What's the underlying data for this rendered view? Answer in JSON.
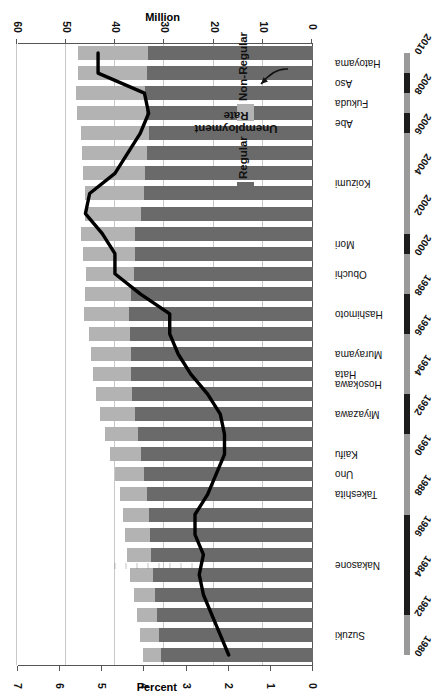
{
  "chart_data": {
    "type": "bar",
    "orientation": "horizontal-stacked-with-line",
    "title": "",
    "subtitle": "",
    "xlabel": "",
    "ylabel": "",
    "grid": true,
    "legend_position": "inside-left",
    "primary_axis": {
      "name": "Million",
      "title": "Million",
      "ticks": [
        0,
        10,
        20,
        30,
        40,
        50,
        60
      ],
      "tick_labels": [
        "0",
        "10",
        "20",
        "30",
        "40",
        "50",
        "60"
      ],
      "lim": [
        0,
        60
      ]
    },
    "secondary_axis": {
      "name": "Percent",
      "title": "Percent",
      "ticks": [
        0,
        1,
        2,
        3,
        4,
        5,
        6,
        7
      ],
      "tick_labels": [
        "0",
        "1",
        "2",
        "3",
        "4",
        "5",
        "6",
        "7"
      ],
      "lim": [
        0,
        7
      ]
    },
    "categories": [
      "1980",
      "1981",
      "1982",
      "1983",
      "1984",
      "1985",
      "1986",
      "1987",
      "1988",
      "1989",
      "1990",
      "1991",
      "1992",
      "1993",
      "1994",
      "1995",
      "1996",
      "1997",
      "1998",
      "1999",
      "2000",
      "2001",
      "2002",
      "2003",
      "2004",
      "2005",
      "2006",
      "2007",
      "2008",
      "2009",
      "2010"
    ],
    "category_axis_labels": [
      "1980",
      "1982",
      "1984",
      "1986",
      "1988",
      "1990",
      "1992",
      "1994",
      "1996",
      "1998",
      "2000",
      "2002",
      "2004",
      "2006",
      "2008",
      "2010"
    ],
    "series": [
      {
        "name": "Regular",
        "color": "#6a6a6a",
        "unit": "Million",
        "values": [
          31.0,
          31.4,
          31.8,
          32.2,
          32.6,
          32.9,
          33.2,
          33.4,
          33.8,
          34.3,
          34.9,
          35.6,
          36.3,
          36.8,
          37.0,
          37.1,
          37.2,
          37.5,
          37.0,
          36.4,
          36.3,
          36.2,
          34.9,
          34.4,
          34.1,
          33.7,
          33.4,
          33.9,
          34.1,
          33.8,
          33.6
        ]
      },
      {
        "name": "Non-Regular",
        "color": "#b3b3b3",
        "unit": "Million",
        "values": [
          3.5,
          3.7,
          3.9,
          4.3,
          4.6,
          4.9,
          5.1,
          5.3,
          5.5,
          6.0,
          6.4,
          6.7,
          7.0,
          7.4,
          7.7,
          8.0,
          8.4,
          9.0,
          9.4,
          9.8,
          10.4,
          11.0,
          11.5,
          12.0,
          12.7,
          13.2,
          13.7,
          14.0,
          14.1,
          13.9,
          14.1
        ]
      },
      {
        "name": "Unemployment Rate",
        "type": "line",
        "color": "#000000",
        "unit": "Percent",
        "axis": "secondary",
        "values": [
          2.0,
          2.2,
          2.4,
          2.6,
          2.7,
          2.6,
          2.8,
          2.8,
          2.5,
          2.3,
          2.1,
          2.1,
          2.2,
          2.5,
          2.9,
          3.2,
          3.4,
          3.4,
          4.1,
          4.7,
          4.7,
          5.0,
          5.4,
          5.3,
          4.7,
          4.4,
          4.1,
          3.9,
          4.0,
          5.1,
          5.1
        ]
      }
    ],
    "annotations": [
      {
        "name": "unemployment-rate-callout",
        "text_line1": "Unemployment",
        "text_line2": "Rate"
      }
    ],
    "prime_ministers": [
      {
        "name": "Suzuki",
        "start": 1980,
        "end": 1982
      },
      {
        "name": "Nakasone",
        "start": 1982,
        "end": 1987
      },
      {
        "name": "Takeshita",
        "start": 1987,
        "end": 1989
      },
      {
        "name": "Uno",
        "start": 1989,
        "end": 1989
      },
      {
        "name": "Kaifu",
        "start": 1989,
        "end": 1991
      },
      {
        "name": "Miyazawa",
        "start": 1991,
        "end": 1993
      },
      {
        "name": "Hosokawa",
        "start": 1993,
        "end": 1994
      },
      {
        "name": "Hata",
        "start": 1994,
        "end": 1994
      },
      {
        "name": "Murayama",
        "start": 1994,
        "end": 1996
      },
      {
        "name": "Hashimoto",
        "start": 1996,
        "end": 1998
      },
      {
        "name": "Obuchi",
        "start": 1998,
        "end": 2000
      },
      {
        "name": "Mori",
        "start": 2000,
        "end": 2001
      },
      {
        "name": "Koizumi",
        "start": 2001,
        "end": 2006
      },
      {
        "name": "Abe",
        "start": 2006,
        "end": 2007
      },
      {
        "name": "Fukuda",
        "start": 2007,
        "end": 2008
      },
      {
        "name": "Aso",
        "start": 2008,
        "end": 2009
      },
      {
        "name": "Hatoyama",
        "start": 2009,
        "end": 2010
      }
    ]
  },
  "legend": {
    "items": [
      {
        "label": "Regular",
        "color": "#6a6a6a"
      },
      {
        "label": "Non-Regular",
        "color": "#b3b3b3"
      }
    ]
  },
  "axes": {
    "primary_title": "Million",
    "secondary_title": "Percent"
  },
  "annotation": {
    "line1": "Unemployment",
    "line2": "Rate"
  },
  "colors": {
    "regular": "#6a6a6a",
    "non_regular": "#b3b3b3",
    "line": "#000000",
    "grid": "#c9c9c9",
    "axis": "#555555",
    "rail_light": "#9a9a9a",
    "rail_dark": "#1c1c1c"
  }
}
